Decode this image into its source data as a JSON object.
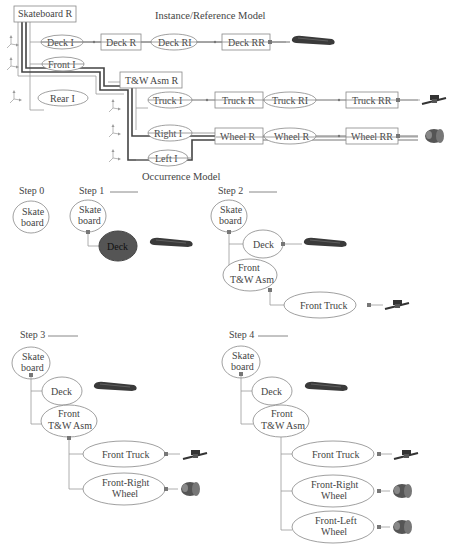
{
  "reference_model": {
    "title": "Instance/Reference Model",
    "root": "Skateboard R",
    "instances": [
      "Deck I",
      "Front I",
      "Rear I"
    ],
    "deck_chain": [
      "Deck R",
      "Deck RI",
      "Deck RR"
    ],
    "assembly": "T&W Asm R",
    "assembly_instances": [
      "Truck I",
      "Right I",
      "Left I"
    ],
    "truck_chain": [
      "Truck R",
      "Truck RI",
      "Truck RR"
    ],
    "wheel_chain": [
      "Wheel R",
      "Wheel R",
      "Wheel RR"
    ]
  },
  "occurrence_model": {
    "title": "Occurrence Model",
    "steps": [
      {
        "label": "Step 0",
        "root": [
          "Skate",
          "board"
        ]
      },
      {
        "label": "Step 1",
        "root": [
          "Skate",
          "board"
        ],
        "children": [
          "Deck"
        ]
      },
      {
        "label": "Step 2",
        "root": [
          "Skate",
          "board"
        ],
        "children": [
          "Deck",
          "Front",
          "T&W Asm",
          "Front Truck"
        ]
      },
      {
        "label": "Step 3",
        "root": [
          "Skate",
          "board"
        ],
        "children": [
          "Deck",
          "Front",
          "T&W Asm",
          "Front Truck",
          "Front-Right",
          "Wheel"
        ]
      },
      {
        "label": "Step 4",
        "root": [
          "Skate",
          "board"
        ],
        "children": [
          "Deck",
          "Front",
          "T&W Asm",
          "Front Truck",
          "Front-Right",
          "Wheel",
          "Front-Left",
          "Wheel"
        ]
      }
    ]
  },
  "colors": {
    "line": "#999999",
    "highlight_path": "#444444",
    "filled_node": "#555555"
  }
}
